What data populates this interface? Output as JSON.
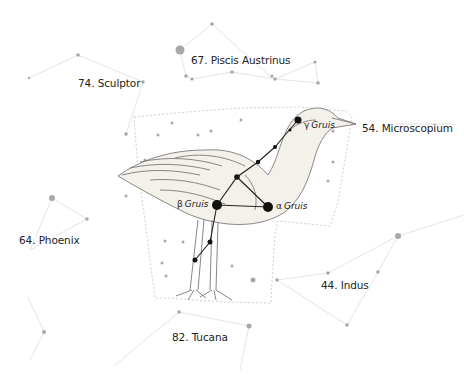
{
  "figure": {
    "main_constellation": "Grus",
    "colors": {
      "background": "#ffffff",
      "neighbor_lines": "#e2e2e2",
      "neighbor_stars": "#a8a8a8",
      "boundary": "#c8c8c8",
      "grus_lines": "#222222",
      "grus_stars": "#111111",
      "illustration": "#7a7a7a",
      "text": "#222222"
    }
  },
  "constellation_labels": [
    {
      "id": "piscis-austrinus",
      "text": "67. Piscis Austrinus"
    },
    {
      "id": "sculptor",
      "text": "74. Sculptor"
    },
    {
      "id": "microscopium",
      "text": "54. Microscopium"
    },
    {
      "id": "phoenix",
      "text": "64. Phoenix"
    },
    {
      "id": "indus",
      "text": "44. Indus"
    },
    {
      "id": "tucana",
      "text": "82. Tucana"
    }
  ],
  "star_labels": {
    "gamma": {
      "greek": "γ",
      "name": "Gruis"
    },
    "beta": {
      "greek": "β",
      "name": "Gruis"
    },
    "alpha": {
      "greek": "α",
      "name": "Gruis"
    }
  }
}
